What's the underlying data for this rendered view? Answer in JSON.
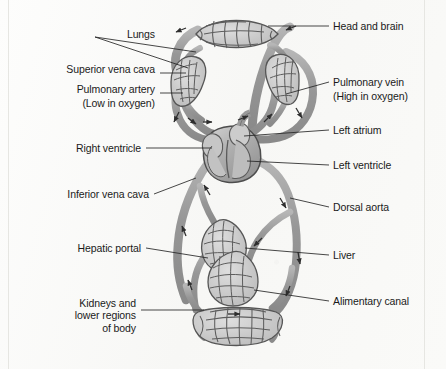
{
  "diagram": {
    "colors": {
      "vessel_fill": "#9a9a9a",
      "vessel_stroke": "#4a4a4a",
      "capillary_fill": "#c9c9c9",
      "heart_fill": "#b5b5b5",
      "leader_line": "#2b2b2b",
      "text": "#1a1a1a",
      "paper": "#fbfbfa",
      "frame": "#e2e2de"
    }
  },
  "labels_left": [
    {
      "id": "lungs",
      "text": "Lungs",
      "align": "right",
      "x": 88,
      "y": 34
    },
    {
      "id": "superior-vena-cava",
      "text": "Superior vena cava",
      "align": "right",
      "x": 155,
      "y": 69
    },
    {
      "id": "pulmonary-artery",
      "text": "Pulmonary artery",
      "align": "right",
      "x": 155,
      "y": 89
    },
    {
      "id": "pulmonary-artery-note",
      "text": "(Low in oxygen)",
      "align": "right",
      "x": 155,
      "y": 104
    },
    {
      "id": "right-ventricle",
      "text": "Right ventricle",
      "align": "right",
      "x": 140,
      "y": 144
    },
    {
      "id": "inferior-vena-cava",
      "text": "Inferior vena cava",
      "align": "right",
      "x": 148,
      "y": 190
    },
    {
      "id": "hepatic-portal",
      "text": "Hepatic portal",
      "align": "right",
      "x": 140,
      "y": 244
    },
    {
      "id": "kidneys-lower-body",
      "text": "Kidneys and\nlower regions\nof body",
      "align": "right",
      "x": 135,
      "y": 300
    }
  ],
  "labels_right": [
    {
      "id": "head-and-brain",
      "text": "Head and brain",
      "align": "left",
      "x": 333,
      "y": 22
    },
    {
      "id": "pulmonary-vein",
      "text": "Pulmonary vein",
      "align": "left",
      "x": 333,
      "y": 76
    },
    {
      "id": "pulmonary-vein-note",
      "text": "(High in oxygen)",
      "align": "left",
      "x": 333,
      "y": 91
    },
    {
      "id": "left-atrium",
      "text": "Left atrium",
      "align": "left",
      "x": 333,
      "y": 126
    },
    {
      "id": "left-ventricle",
      "text": "Left ventricle",
      "align": "left",
      "x": 333,
      "y": 161
    },
    {
      "id": "dorsal-aorta",
      "text": "Dorsal aorta",
      "align": "left",
      "x": 333,
      "y": 203
    },
    {
      "id": "liver",
      "text": "Liver",
      "align": "left",
      "x": 333,
      "y": 251
    },
    {
      "id": "alimentary-canal",
      "text": "Alimentary canal",
      "align": "left",
      "x": 333,
      "y": 297
    }
  ],
  "organs": [
    {
      "id": "head-and-brain-capillaries",
      "name": "head and brain capillary bed"
    },
    {
      "id": "left-lung-capillaries",
      "name": "left lung capillary bed"
    },
    {
      "id": "right-lung-capillaries",
      "name": "right lung capillary bed"
    },
    {
      "id": "heart",
      "name": "heart"
    },
    {
      "id": "liver-capillaries",
      "name": "liver capillary bed"
    },
    {
      "id": "alimentary-canal-capillaries",
      "name": "alimentary canal capillary bed"
    },
    {
      "id": "kidneys-capillaries",
      "name": "kidneys and lower body capillary bed"
    }
  ],
  "flow_arrows_count": 14
}
